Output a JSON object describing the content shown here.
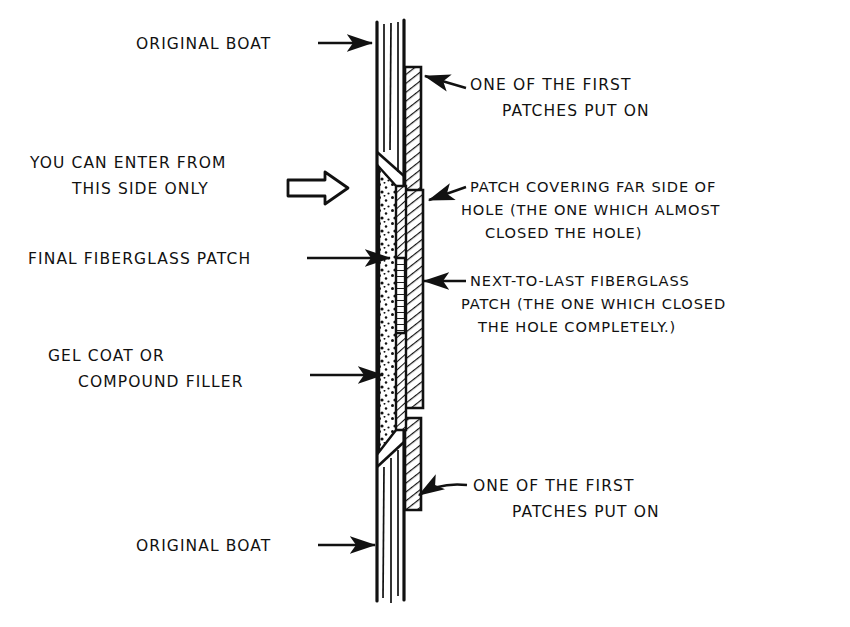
{
  "figure": {
    "ink_color": "#111111",
    "background_color": "#ffffff"
  },
  "annotations": {
    "original_boat_top": {
      "lines": [
        "ORIGINAL BOAT"
      ],
      "pointer": "arrow-right"
    },
    "first_patches_top": {
      "lines": [
        "ONE OF THE FIRST",
        "PATCHES PUT ON"
      ],
      "pointer": "arrow-left"
    },
    "enter_from_side": {
      "lines": [
        "YOU CAN ENTER FROM",
        "THIS SIDE ONLY"
      ],
      "pointer": "block-arrow-right"
    },
    "patch_far_side": {
      "lines": [
        "PATCH COVERING FAR SIDE OF",
        "HOLE (THE ONE WHICH ALMOST",
        "CLOSED THE HOLE)"
      ],
      "pointer": "arrow-left"
    },
    "final_fiberglass_patch": {
      "lines": [
        "FINAL FIBERGLASS PATCH"
      ],
      "pointer": "arrow-right"
    },
    "next_to_last_patch": {
      "lines": [
        "NEXT-TO-LAST FIBERGLASS",
        "PATCH (THE ONE WHICH CLOSED",
        "THE HOLE COMPLETELY.)"
      ],
      "pointer": "arrow-left"
    },
    "gel_coat_filler": {
      "lines": [
        "GEL COAT OR",
        "COMPOUND FILLER"
      ],
      "pointer": "arrow-right"
    },
    "first_patches_bottom": {
      "lines": [
        "ONE OF THE FIRST",
        "PATCHES PUT ON"
      ],
      "pointer": "arrow-left"
    },
    "original_boat_bottom": {
      "lines": [
        "ORIGINAL BOAT"
      ],
      "pointer": "arrow-right"
    }
  },
  "diagram_parts": {
    "hull_laminate": "original-boat-hull",
    "outer_patch": "first-patches-hatched-layer",
    "filler_zone": "gel-coat-compound-filler-stipple",
    "far_side_patch": "patch-covering-far-side-of-hole",
    "next_to_last_patch": "next-to-last-fiberglass-patch",
    "final_patch": "final-fiberglass-patch"
  }
}
